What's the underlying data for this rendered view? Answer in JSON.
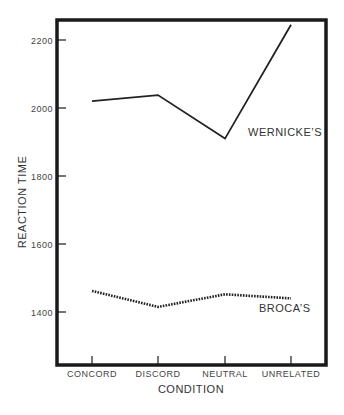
{
  "chart_data": {
    "type": "line",
    "title": "",
    "xlabel": "CONDITION",
    "ylabel": "REACTION TIME",
    "categories": [
      "CONCORD",
      "DISCORD",
      "NEUTRAL",
      "UNRELATED"
    ],
    "series": [
      {
        "name": "WERNICKE'S",
        "label": "WERNICKE’S",
        "style": "solid",
        "values": [
          2020,
          2038,
          1910,
          2245
        ]
      },
      {
        "name": "BROCA'S",
        "label": "BROCA’S",
        "style": "dotted",
        "values": [
          1462,
          1415,
          1452,
          1440
        ]
      }
    ],
    "yticks": [
      1400,
      1600,
      1800,
      2000,
      2200
    ],
    "ytick_labels": [
      "1400",
      "1600",
      "1800",
      "2000",
      "2200"
    ],
    "ylim": [
      1250,
      2260
    ],
    "grid": false,
    "legend": "inline labels next to lines",
    "colors": {
      "line": "#222222",
      "frame": "#1a1a1a",
      "text": "#444444"
    }
  }
}
